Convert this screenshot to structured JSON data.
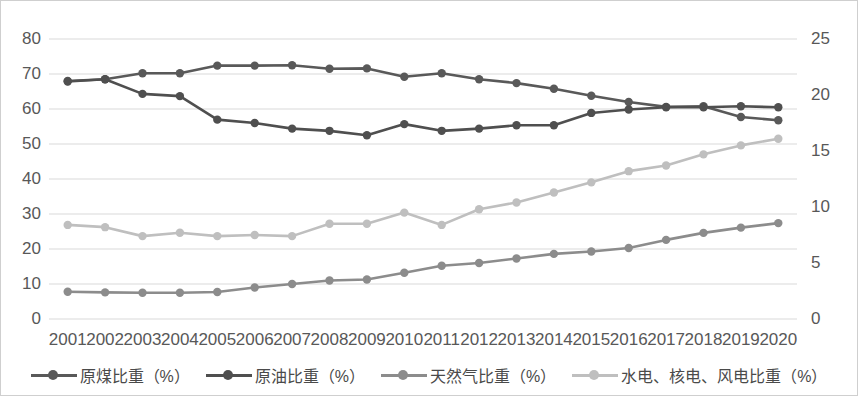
{
  "chart_data": {
    "type": "line",
    "title": "",
    "subtitle": "",
    "xlabel": "",
    "ylabel": "",
    "y2label": "",
    "grid": true,
    "legend_position": "bottom",
    "categories": [
      "2001",
      "2002",
      "2003",
      "2004",
      "2005",
      "2006",
      "2007",
      "2008",
      "2009",
      "2010",
      "2011",
      "2012",
      "2013",
      "2014",
      "2015",
      "2016",
      "2017",
      "2018",
      "2019",
      "2020"
    ],
    "axes": {
      "left": {
        "min": 0,
        "max": 80,
        "step": 10,
        "ticks": [
          "0",
          "10",
          "20",
          "30",
          "40",
          "50",
          "60",
          "70",
          "80"
        ]
      },
      "right": {
        "min": 0,
        "max": 25,
        "step": 5,
        "ticks": [
          "0",
          "5",
          "10",
          "15",
          "20",
          "25"
        ]
      }
    },
    "series": [
      {
        "name": "原煤比重（%）",
        "axis": "left",
        "color": "#595959",
        "values": [
          68.0,
          68.5,
          70.2,
          70.2,
          72.4,
          72.4,
          72.5,
          71.5,
          71.6,
          69.2,
          70.2,
          68.5,
          67.4,
          65.8,
          63.8,
          62.0,
          60.6,
          60.8,
          57.7,
          56.8
        ]
      },
      {
        "name": "原油比重（%）",
        "axis": "right",
        "color": "#4f4f4f",
        "values": [
          21.2,
          21.4,
          20.1,
          19.9,
          17.8,
          17.5,
          17.0,
          16.8,
          16.4,
          17.4,
          16.8,
          17.0,
          17.3,
          17.3,
          18.4,
          18.7,
          18.9,
          18.9,
          19.0,
          18.9
        ]
      },
      {
        "name": "天然气比重（%）",
        "axis": "left",
        "color": "#8c8c8c",
        "values": [
          7.8,
          7.6,
          7.5,
          7.5,
          7.7,
          9.0,
          10.0,
          11.0,
          11.3,
          13.2,
          15.2,
          16.0,
          17.3,
          18.6,
          19.3,
          20.3,
          22.6,
          24.6,
          26.1,
          27.4
        ]
      },
      {
        "name": "水电、核电、风电比重（%）",
        "axis": "right",
        "color": "#bfbfbf",
        "values": [
          8.4,
          8.2,
          7.4,
          7.7,
          7.4,
          7.5,
          7.4,
          8.5,
          8.5,
          9.5,
          8.4,
          9.8,
          10.4,
          11.3,
          12.2,
          13.2,
          13.7,
          14.7,
          15.5,
          16.1
        ]
      }
    ]
  },
  "legend": {
    "items": [
      {
        "label": "原煤比重（%）",
        "color": "#595959"
      },
      {
        "label": "原油比重（%）",
        "color": "#4f4f4f"
      },
      {
        "label": "天然气比重（%）",
        "color": "#8c8c8c"
      },
      {
        "label": "水电、核电、风电比重（%）",
        "color": "#bfbfbf"
      }
    ]
  },
  "style": {
    "background": "#ffffff",
    "border": "#cfcfcf",
    "gridline": "#d9d9d9",
    "tick_text": "#585858"
  }
}
